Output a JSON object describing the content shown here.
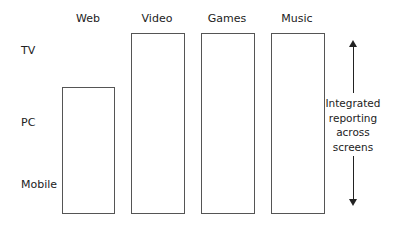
{
  "columns": [
    {
      "label": "Web"
    },
    {
      "label": "Video"
    },
    {
      "label": "Games"
    },
    {
      "label": "Music"
    }
  ],
  "rows": [
    {
      "label": "TV"
    },
    {
      "label": "PC"
    },
    {
      "label": "Mobile"
    }
  ],
  "side_note": {
    "lines": [
      "Integrated",
      "reporting",
      "across",
      "screens"
    ]
  },
  "bars": [
    {
      "column": "Web",
      "spans_from": "PC",
      "spans_to": "Mobile"
    },
    {
      "column": "Video",
      "spans_from": "TV",
      "spans_to": "Mobile"
    },
    {
      "column": "Games",
      "spans_from": "TV",
      "spans_to": "Mobile"
    },
    {
      "column": "Music",
      "spans_from": "TV",
      "spans_to": "Mobile"
    }
  ]
}
